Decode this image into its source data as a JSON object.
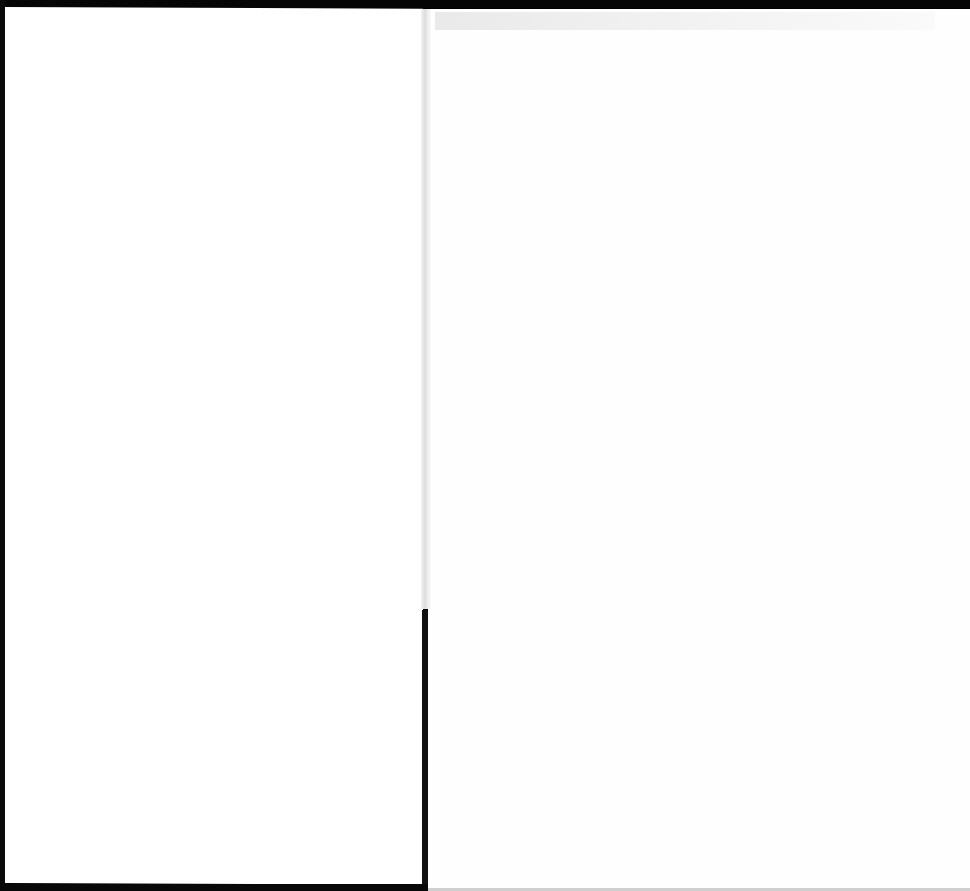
{
  "document": {
    "type": "scanned two-page spread",
    "pages": [
      {
        "side": "left",
        "content": ""
      },
      {
        "side": "right",
        "content": ""
      }
    ]
  }
}
